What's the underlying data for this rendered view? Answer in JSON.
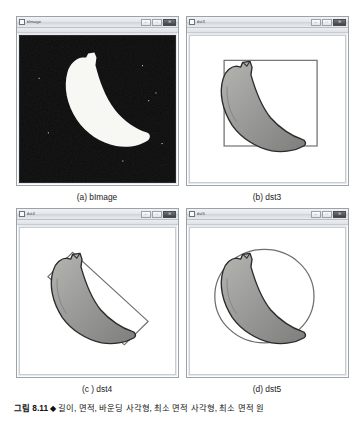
{
  "figure": {
    "number": "그림 8.11",
    "separator": "◆",
    "caption_text": "길이, 면적, 바운딩 사각형, 최소 면적 사각형, 최소 면적 원"
  },
  "panels": [
    {
      "id": "a",
      "caption": "(a) bImage",
      "window_title": "bImage",
      "canvas_kind": "binary",
      "overlay": "none",
      "description": "binary threshold image, white banana silhouette on black background"
    },
    {
      "id": "b",
      "caption": "(b) dst3",
      "window_title": "dst3",
      "canvas_kind": "grayscale",
      "overlay": "bounding-rect",
      "description": "grayscale banana with axis-aligned bounding rectangle"
    },
    {
      "id": "c",
      "caption": "(c ) dst4",
      "window_title": "dst4",
      "canvas_kind": "grayscale",
      "overlay": "min-area-rect",
      "description": "grayscale banana with rotated minimum-area rectangle"
    },
    {
      "id": "d",
      "caption": "(d) dst5",
      "window_title": "dst5",
      "canvas_kind": "grayscale",
      "overlay": "min-enclosing-circle",
      "description": "grayscale banana with minimum enclosing circle"
    }
  ],
  "window_controls": {
    "minimize_label": "–",
    "maximize_label": "□",
    "close_label": "✕"
  },
  "colors": {
    "background": "#ffffff",
    "binary_bg": "#0a0a0a",
    "binary_fg": "#f7f7f4",
    "banana_fill": "#9b9b99",
    "banana_outline": "#2b2b2b",
    "overlay_stroke": "#6e6e6e",
    "titlebar": "#e3e6ea",
    "window_border": "#9aa2aa"
  }
}
